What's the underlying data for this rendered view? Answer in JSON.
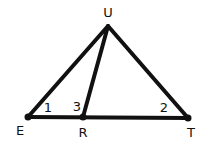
{
  "diagram": {
    "type": "geometry-triangle",
    "colors": {
      "stroke": "#111111",
      "background": "#ffffff"
    },
    "points": [
      {
        "id": "U",
        "label": "U",
        "x": 108,
        "y": 26,
        "lx": 108,
        "ly": 17
      },
      {
        "id": "E",
        "label": "E",
        "x": 28,
        "y": 117,
        "lx": 20,
        "ly": 135
      },
      {
        "id": "R",
        "label": "R",
        "x": 83,
        "y": 117,
        "lx": 83,
        "ly": 137
      },
      {
        "id": "T",
        "label": "T",
        "x": 188,
        "y": 118,
        "lx": 191,
        "ly": 137
      }
    ],
    "segments": [
      {
        "from": "E",
        "to": "U"
      },
      {
        "from": "U",
        "to": "T"
      },
      {
        "from": "U",
        "to": "R"
      },
      {
        "from": "E",
        "to": "T"
      }
    ],
    "angles": [
      {
        "label": "1",
        "vertex": "E",
        "x": 48,
        "y": 112
      },
      {
        "label": "3",
        "vertex": "R",
        "x": 77,
        "y": 111
      },
      {
        "label": "2",
        "vertex": "T",
        "x": 164,
        "y": 112
      }
    ]
  }
}
